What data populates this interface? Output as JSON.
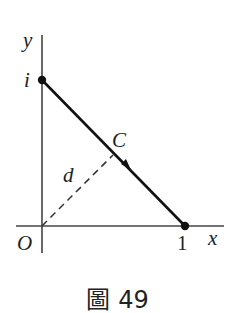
{
  "figure": {
    "labels": {
      "y_axis": "y",
      "x_axis": "x",
      "origin": "O",
      "point_i": "i",
      "point_one": "1",
      "curve": "C",
      "distance": "d"
    },
    "caption": {
      "prefix": "圖",
      "number": "49"
    },
    "colors": {
      "axis": "#444444",
      "segment": "#111111",
      "dashed": "#333333",
      "text": "#222222"
    }
  }
}
